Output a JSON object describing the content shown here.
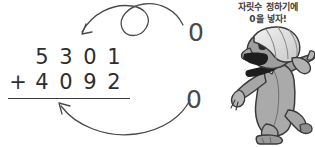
{
  "page": {
    "background_color": "#ffffff",
    "ink_color": "#3a3a3a"
  },
  "speech": {
    "line1": "자릿수 정하기에",
    "line2": "0을 넣자!"
  },
  "addition": {
    "top_operand": {
      "operator": "",
      "digits": [
        "5",
        "3",
        "0",
        "1"
      ]
    },
    "bottom_operand": {
      "operator": "+",
      "digits": [
        "4",
        "0",
        "9",
        "2"
      ]
    },
    "rule_visible": "true"
  },
  "annotations": {
    "zero_top": "0",
    "zero_bottom": "0",
    "arrow_top_name": "looping arrow pointing to tens place",
    "arrow_bottom_name": "curved arrow pointing to ones place"
  },
  "character": {
    "description": "cartoon grandfather running and shouting",
    "skin_color": "#9a9a9a",
    "robe_color": "#a8a8a8",
    "cap_color": "#e0e0e0",
    "outline_color": "#3a3a3a",
    "mouth_color": "#1d1d1d"
  }
}
